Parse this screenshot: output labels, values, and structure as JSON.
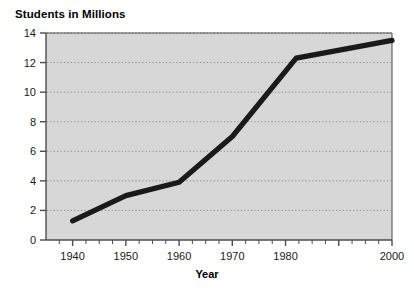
{
  "chart_data": {
    "type": "line",
    "title": "",
    "ylabel": "Students in Millions",
    "xlabel": "Year",
    "x": [
      1940,
      1950,
      1960,
      1970,
      1982,
      2000
    ],
    "values": [
      1.3,
      3.0,
      3.9,
      7.0,
      12.3,
      13.5
    ],
    "series": [
      {
        "name": "Students in Millions",
        "x": [
          1940,
          1950,
          1960,
          1970,
          1982,
          2000
        ],
        "values": [
          1.3,
          3.0,
          3.9,
          7.0,
          12.3,
          13.5
        ]
      }
    ],
    "xlim": [
      1935,
      2000
    ],
    "ylim": [
      0,
      14
    ],
    "xticks": [
      1940,
      1950,
      1960,
      1970,
      1980,
      1990,
      2000
    ],
    "xtick_labels": [
      "1940",
      "1950",
      "1960",
      "1970",
      "1980",
      "",
      "2000"
    ],
    "yticks": [
      0,
      2,
      4,
      6,
      8,
      10,
      12,
      14
    ],
    "ytick_labels": [
      "0",
      "2",
      "4",
      "6",
      "8",
      "10",
      "12",
      "14"
    ],
    "grid": "horizontal-dotted",
    "legend": "none",
    "line_color": "#1a1a1a",
    "plot_background": "#d7d7d7"
  },
  "axis": {
    "y_title": "Students in Millions",
    "x_title": "Year",
    "y_labels": [
      "14",
      "12",
      "10",
      "8",
      "6",
      "4",
      "2",
      "0"
    ],
    "x_labels": [
      "1940",
      "1950",
      "1960",
      "1970",
      "1980",
      "2000"
    ]
  },
  "colors": {
    "line": "#1a1a1a",
    "plot_bg": "#d7d7d7",
    "grid": "#8d8d8d",
    "axis": "#4d4d4d",
    "page_bg": "#ffffff"
  }
}
